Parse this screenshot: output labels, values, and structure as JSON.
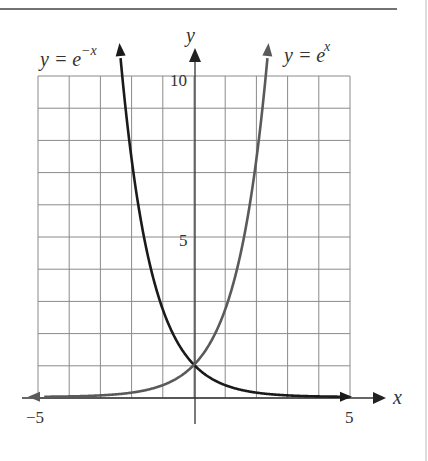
{
  "chart_data": {
    "type": "line",
    "title": "",
    "xlabel": "x",
    "ylabel": "y",
    "xlim": [
      -5,
      5
    ],
    "ylim": [
      0,
      10
    ],
    "grid": true,
    "x_ticks_labeled": [
      {
        "value": -5,
        "label": "−5"
      },
      {
        "value": 5,
        "label": "5"
      }
    ],
    "y_ticks_labeled": [
      {
        "value": 5,
        "label": "5"
      },
      {
        "value": 10,
        "label": "10"
      }
    ],
    "series": [
      {
        "name": "y = e^{-x}",
        "label_base": "y = e",
        "label_exp": "−x",
        "color": "#1a1a1a",
        "x": [
          -5,
          -4,
          -3,
          -2.5,
          -2.3,
          -2,
          -1.5,
          -1,
          -0.5,
          0,
          0.5,
          1,
          1.5,
          2,
          3,
          4,
          5
        ],
        "y": [
          148.4,
          54.6,
          20.1,
          12.18,
          9.97,
          7.39,
          4.48,
          2.72,
          1.65,
          1,
          0.61,
          0.37,
          0.22,
          0.14,
          0.05,
          0.02,
          0.01
        ]
      },
      {
        "name": "y = e^{x}",
        "label_base": "y = e",
        "label_exp": "x",
        "color": "#555555",
        "x": [
          -5,
          -4,
          -3,
          -2,
          -1.5,
          -1,
          -0.5,
          0,
          0.5,
          1,
          1.5,
          2,
          2.3,
          2.5,
          3,
          4,
          5
        ],
        "y": [
          0.01,
          0.02,
          0.05,
          0.14,
          0.22,
          0.37,
          0.61,
          1,
          1.65,
          2.72,
          4.48,
          7.39,
          9.97,
          12.18,
          20.1,
          54.6,
          148.4
        ]
      }
    ],
    "annotations": [
      "y = e^{-x}",
      "y = e^{x}"
    ],
    "legend": "none (curves labeled directly)"
  },
  "labels": {
    "x_axis": "x",
    "y_axis": "y",
    "x_min": "−5",
    "x_max": "5",
    "y_mid": "5",
    "y_max": "10",
    "curve_left_base": "y = e",
    "curve_left_exp": "−x",
    "curve_right_base": "y = e",
    "curve_right_exp": "x"
  }
}
